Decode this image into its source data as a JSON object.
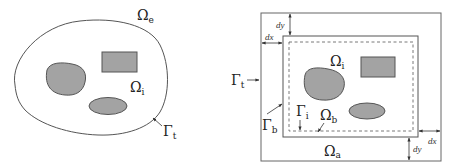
{
  "colors": {
    "stroke": "#555555",
    "fill": "#a3a3a3",
    "text": "#222222",
    "background": "#ffffff"
  },
  "left_diagram": {
    "domain_exterior_label": {
      "base": "Ω",
      "sub": "e"
    },
    "domain_interior_label": {
      "base": "Ω",
      "sub": "i"
    },
    "boundary_label": {
      "base": "Γ",
      "sub": "t"
    },
    "inclusions": [
      "blob",
      "rectangle",
      "ellipse"
    ]
  },
  "right_diagram": {
    "outer_boundary_label": {
      "base": "Γ",
      "sub": "t"
    },
    "inner_boundary_label": {
      "base": "Γ",
      "sub": "b"
    },
    "dashed_boundary_label": {
      "base": "Γ",
      "sub": "i"
    },
    "interior_label": {
      "base": "Ω",
      "sub": "i"
    },
    "buffer_label": {
      "base": "Ω",
      "sub": "b"
    },
    "absorbing_label": {
      "base": "Ω",
      "sub": "a"
    },
    "offset_labels": {
      "dx_top": "dx",
      "dy_top": "dy",
      "dx_bottom": "dx",
      "dy_bottom": "dy"
    },
    "inclusions": [
      "blob",
      "rectangle",
      "ellipse"
    ]
  }
}
